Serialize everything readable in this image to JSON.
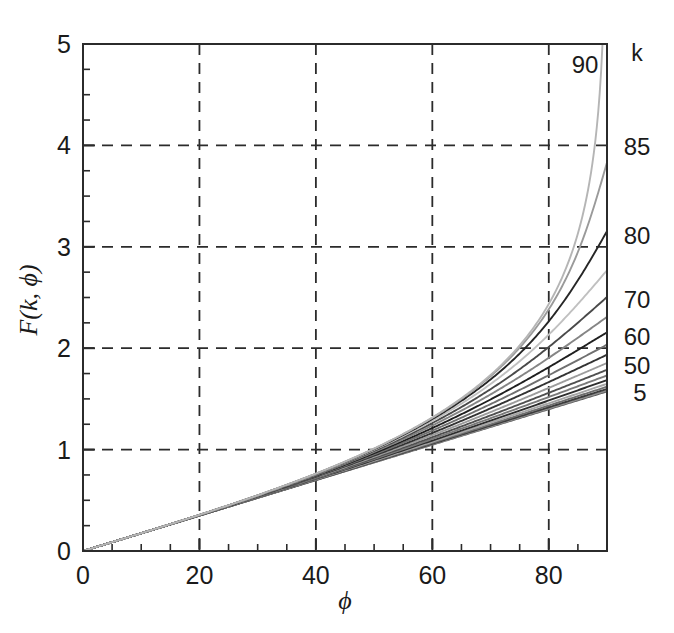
{
  "chart_data": {
    "type": "line",
    "title": "",
    "subtitle": "",
    "xlabel": "ϕ",
    "ylabel": "F(k, ϕ)",
    "xlim": [
      0,
      90
    ],
    "ylim": [
      0,
      5
    ],
    "xticks": [
      0,
      20,
      40,
      60,
      80
    ],
    "xtick_labels": [
      "0",
      "20",
      "40",
      "60",
      "80"
    ],
    "xtick_minor_step": 5,
    "yticks": [
      0,
      1,
      2,
      3,
      4,
      5
    ],
    "ytick_labels": [
      "0",
      "1",
      "2",
      "3",
      "4",
      "5"
    ],
    "ytick_minor_step": 0.25,
    "grid": true,
    "grid_style": "dashed",
    "grid_x": [
      20,
      40,
      60,
      80
    ],
    "grid_y": [
      1,
      2,
      3,
      4
    ],
    "legend_position": "right-edge-inline",
    "legend_title": "k",
    "series_parameter": "k",
    "series_parameter_unit": "degrees",
    "x_unit": "degrees",
    "x_sample_points": [
      0,
      5,
      10,
      15,
      20,
      25,
      30,
      35,
      40,
      45,
      50,
      55,
      60,
      65,
      70,
      75,
      80,
      85,
      90
    ],
    "series": [
      {
        "name": "5",
        "k": 5,
        "label": "5",
        "labeled": true,
        "color": "#5a5a5a",
        "values": [
          0.0,
          0.087,
          0.175,
          0.262,
          0.349,
          0.437,
          0.524,
          0.611,
          0.699,
          0.786,
          0.874,
          0.961,
          1.049,
          1.137,
          1.224,
          1.312,
          1.4,
          1.488,
          1.576
        ]
      },
      {
        "name": "10",
        "k": 10,
        "label": "",
        "labeled": false,
        "color": "#8f8f8f",
        "values": [
          0.0,
          0.087,
          0.175,
          0.262,
          0.35,
          0.438,
          0.526,
          0.614,
          0.703,
          0.792,
          0.881,
          0.971,
          1.061,
          1.151,
          1.242,
          1.333,
          1.424,
          1.515,
          1.606
        ]
      },
      {
        "name": "15",
        "k": 15,
        "label": "",
        "labeled": false,
        "color": "#3c3c3c",
        "values": [
          0.0,
          0.087,
          0.175,
          0.263,
          0.351,
          0.44,
          0.529,
          0.619,
          0.71,
          0.801,
          0.893,
          0.986,
          1.08,
          1.175,
          1.27,
          1.365,
          1.461,
          1.557,
          1.653
        ]
      },
      {
        "name": "20",
        "k": 20,
        "label": "",
        "labeled": false,
        "color": "#6e6e6e",
        "values": [
          0.0,
          0.087,
          0.175,
          0.264,
          0.353,
          0.443,
          0.534,
          0.626,
          0.72,
          0.815,
          0.911,
          1.009,
          1.108,
          1.208,
          1.31,
          1.412,
          1.515,
          1.618,
          1.721
        ]
      },
      {
        "name": "25",
        "k": 25,
        "label": "",
        "labeled": false,
        "color": "#a6a6a6",
        "values": [
          0.0,
          0.088,
          0.176,
          0.265,
          0.355,
          0.447,
          0.54,
          0.636,
          0.733,
          0.833,
          0.935,
          1.039,
          1.146,
          1.255,
          1.365,
          1.477,
          1.59,
          1.703,
          1.817
        ]
      },
      {
        "name": "30",
        "k": 30,
        "label": "",
        "labeled": false,
        "color": "#2e2e2e",
        "values": [
          0.0,
          0.088,
          0.176,
          0.266,
          0.358,
          0.452,
          0.548,
          0.647,
          0.749,
          0.854,
          0.963,
          1.076,
          1.192,
          1.312,
          1.435,
          1.561,
          1.688,
          1.817,
          1.947
        ]
      },
      {
        "name": "35",
        "k": 35,
        "label": "",
        "labeled": false,
        "color": "#7a7a7a",
        "values": [
          0.0,
          0.088,
          0.177,
          0.268,
          0.361,
          0.457,
          0.557,
          0.66,
          0.768,
          0.88,
          0.997,
          1.12,
          1.247,
          1.38,
          1.518,
          1.66,
          1.806,
          1.954,
          2.105
        ]
      },
      {
        "name": "40",
        "k": 40,
        "label": "",
        "labeled": false,
        "color": "#505050",
        "values": [
          0.0,
          0.088,
          0.177,
          0.269,
          0.364,
          0.463,
          0.566,
          0.675,
          0.789,
          0.91,
          1.037,
          1.172,
          1.313,
          1.462,
          1.618,
          1.781,
          1.95,
          2.124,
          2.302
        ]
      },
      {
        "name": "45",
        "k": 45,
        "label": "",
        "labeled": false,
        "color": "#9c9c9c",
        "values": [
          0.0,
          0.088,
          0.177,
          0.27,
          0.367,
          0.469,
          0.576,
          0.691,
          0.813,
          0.943,
          1.082,
          1.231,
          1.389,
          1.558,
          1.738,
          1.929,
          2.131,
          2.341,
          2.558
        ]
      },
      {
        "name": "50",
        "k": 50,
        "label": "50",
        "labeled": true,
        "color": "#333333",
        "values": [
          0.0,
          0.088,
          0.178,
          0.271,
          0.369,
          0.474,
          0.586,
          0.707,
          0.838,
          0.979,
          1.131,
          1.296,
          1.473,
          1.665,
          1.873,
          2.098,
          2.34,
          2.598,
          2.868
        ]
      },
      {
        "name": "55",
        "k": 55,
        "label": "",
        "labeled": false,
        "color": "#707070",
        "values": [
          0.0,
          0.088,
          0.178,
          0.272,
          0.372,
          0.479,
          0.595,
          0.722,
          0.861,
          1.013,
          1.18,
          1.363,
          1.563,
          1.782,
          2.023,
          2.287,
          2.577,
          2.892,
          3.226
        ]
      },
      {
        "name": "60",
        "k": 60,
        "label": "60",
        "labeled": true,
        "color": "#1f1f1f",
        "values": [
          0.0,
          0.088,
          0.178,
          0.273,
          0.374,
          0.483,
          0.603,
          0.736,
          0.883,
          1.046,
          1.228,
          1.43,
          1.656,
          1.907,
          2.187,
          2.5,
          2.851,
          3.244,
          3.686
        ]
      },
      {
        "name": "65",
        "k": 65,
        "label": "",
        "labeled": false,
        "color": "#858585",
        "values": [
          0.0,
          0.088,
          0.178,
          0.274,
          0.376,
          0.487,
          0.61,
          0.748,
          0.902,
          1.076,
          1.273,
          1.496,
          1.75,
          2.039,
          2.37,
          2.752,
          3.195,
          3.712,
          4.321
        ]
      },
      {
        "name": "70",
        "k": 70,
        "label": "70",
        "labeled": true,
        "color": "#4a4a4a",
        "values": [
          0.0,
          0.088,
          0.179,
          0.274,
          0.378,
          0.49,
          0.617,
          0.759,
          0.92,
          1.104,
          1.315,
          1.558,
          1.84,
          2.169,
          2.556,
          3.018,
          3.577,
          4.27,
          5.156
        ]
      },
      {
        "name": "75",
        "k": 75,
        "label": "",
        "labeled": false,
        "color": "#c0c0c0",
        "values": [
          0.0,
          0.089,
          0.179,
          0.275,
          0.379,
          0.493,
          0.622,
          0.768,
          0.935,
          1.127,
          1.35,
          1.612,
          1.922,
          2.293,
          2.743,
          3.299,
          4.005,
          4.94,
          6.234
        ]
      },
      {
        "name": "80",
        "k": 80,
        "label": "80",
        "labeled": true,
        "color": "#262626",
        "values": [
          0.0,
          0.089,
          0.179,
          0.275,
          0.38,
          0.495,
          0.626,
          0.775,
          0.947,
          1.146,
          1.379,
          1.656,
          1.99,
          2.399,
          2.91,
          3.566,
          4.441,
          5.686,
          7.698
        ]
      },
      {
        "name": "85",
        "k": 85,
        "label": "85",
        "labeled": true,
        "color": "#9a9a9a",
        "values": [
          0.0,
          0.089,
          0.179,
          0.276,
          0.381,
          0.497,
          0.629,
          0.78,
          0.955,
          1.159,
          1.399,
          1.687,
          2.038,
          2.477,
          3.039,
          3.786,
          4.841,
          6.47,
          9.646
        ]
      },
      {
        "name": "90",
        "k": 90,
        "label": "90",
        "labeled": true,
        "color": "#b5b5b5",
        "values": [
          0.0,
          0.089,
          0.179,
          0.276,
          0.382,
          0.498,
          0.631,
          0.783,
          0.961,
          1.169,
          1.414,
          1.71,
          2.074,
          2.536,
          3.142,
          3.979,
          5.238,
          7.488,
          14.0
        ]
      }
    ],
    "inline_labels": [
      {
        "text": "k",
        "position": "legend-title",
        "x_px": 637,
        "y_px": 53
      },
      {
        "text": "90",
        "position": "inside-top-right",
        "x_px": 585,
        "y_px": 65
      },
      {
        "text": "85",
        "position": "right-margin",
        "x_px": 637,
        "y_px": 147
      },
      {
        "text": "80",
        "position": "right-margin",
        "x_px": 637,
        "y_px": 236
      },
      {
        "text": "70",
        "position": "right-margin",
        "x_px": 637,
        "y_px": 300
      },
      {
        "text": "60",
        "position": "right-margin",
        "x_px": 637,
        "y_px": 337
      },
      {
        "text": "50",
        "position": "right-margin",
        "x_px": 637,
        "y_px": 366
      },
      {
        "text": "5",
        "position": "right-margin",
        "x_px": 640,
        "y_px": 393
      }
    ]
  },
  "colors": {
    "background": "#ffffff",
    "axis": "#2b2b2b",
    "grid": "#2b2b2b",
    "text": "#1a1a1a"
  }
}
